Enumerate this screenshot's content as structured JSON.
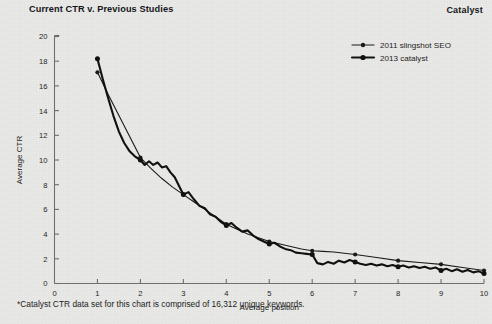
{
  "header": {
    "title": "Current CTR v. Previous Studies",
    "brand": "Catalyst"
  },
  "footnote": "*Catalyst CTR data set for this chart is comprised of 16,312 unique keywords.",
  "colors": {
    "background": "#e9e9e7",
    "ink": "#1b1b1b",
    "axis": "#6d6d6d",
    "series_slingshot": "#1a1a1a",
    "series_catalyst": "#111111"
  },
  "chart_data": {
    "type": "line",
    "title": "Current CTR v. Previous Studies",
    "xlabel": "Average position",
    "ylabel": "Average CTR",
    "xlim": [
      0,
      10
    ],
    "ylim": [
      0,
      20
    ],
    "xticks": [
      0,
      1,
      2,
      3,
      4,
      5,
      6,
      7,
      8,
      9,
      10
    ],
    "yticks": [
      0,
      2,
      4,
      6,
      8,
      10,
      12,
      14,
      16,
      18,
      20
    ],
    "grid": false,
    "legend_position": "top-right",
    "legend": [
      "2011 slingshot SEO",
      "2013 catalyst"
    ],
    "marker_positions": [
      1,
      2,
      3,
      4,
      5,
      6,
      7,
      8,
      9,
      10
    ],
    "series": [
      {
        "name": "2011 slingshot SEO",
        "line_width": 1.1,
        "markers_at": [
          1,
          2,
          3,
          4,
          5,
          6,
          7,
          8,
          9,
          10
        ],
        "x": [
          1,
          1.25,
          1.5,
          1.75,
          2,
          2.25,
          2.5,
          2.75,
          3,
          3.25,
          3.5,
          3.75,
          4,
          4.25,
          4.5,
          4.75,
          5,
          5.25,
          5.5,
          5.75,
          6,
          6.25,
          6.5,
          6.75,
          7,
          7.5,
          8,
          8.5,
          9,
          9.5,
          10
        ],
        "y": [
          17.1,
          15.3,
          13.6,
          11.9,
          10.2,
          9.3,
          8.5,
          7.8,
          7.2,
          6.6,
          6.0,
          5.4,
          4.8,
          4.4,
          4.0,
          3.7,
          3.4,
          3.2,
          3.0,
          2.8,
          2.65,
          2.6,
          2.55,
          2.45,
          2.35,
          2.1,
          1.85,
          1.7,
          1.55,
          1.3,
          1.05
        ]
      },
      {
        "name": "2013 catalyst",
        "line_width": 2.1,
        "markers_at": [
          1,
          2,
          3,
          4,
          5,
          6,
          7,
          8,
          9,
          10
        ],
        "x": [
          1,
          1.12,
          1.25,
          1.37,
          1.5,
          1.62,
          1.75,
          1.87,
          2,
          2.1,
          2.2,
          2.3,
          2.4,
          2.5,
          2.6,
          2.7,
          2.8,
          2.9,
          3,
          3.12,
          3.25,
          3.37,
          3.5,
          3.62,
          3.75,
          3.87,
          4,
          4.12,
          4.25,
          4.37,
          4.5,
          4.62,
          4.75,
          4.87,
          5,
          5.12,
          5.25,
          5.37,
          5.5,
          5.62,
          5.75,
          5.87,
          6,
          6.12,
          6.25,
          6.37,
          6.5,
          6.62,
          6.75,
          6.87,
          7,
          7.12,
          7.25,
          7.37,
          7.5,
          7.62,
          7.75,
          7.87,
          8,
          8.12,
          8.25,
          8.37,
          8.5,
          8.62,
          8.75,
          8.87,
          9,
          9.12,
          9.25,
          9.37,
          9.5,
          9.62,
          9.75,
          9.87,
          10
        ],
        "y": [
          18.2,
          16.6,
          15.0,
          13.6,
          12.3,
          11.4,
          10.7,
          10.3,
          10.0,
          9.6,
          9.9,
          9.6,
          9.8,
          9.4,
          9.5,
          9.0,
          8.6,
          7.9,
          7.2,
          7.4,
          6.8,
          6.3,
          6.1,
          5.6,
          5.4,
          5.0,
          4.7,
          4.9,
          4.5,
          4.2,
          4.3,
          3.9,
          3.6,
          3.4,
          3.2,
          3.3,
          3.0,
          2.8,
          2.7,
          2.5,
          2.45,
          2.4,
          2.35,
          1.65,
          1.55,
          1.75,
          1.6,
          1.85,
          1.7,
          1.9,
          1.75,
          1.6,
          1.5,
          1.6,
          1.45,
          1.55,
          1.4,
          1.5,
          1.35,
          1.45,
          1.3,
          1.4,
          1.25,
          1.35,
          1.2,
          1.3,
          1.05,
          1.2,
          1.0,
          1.15,
          0.95,
          1.1,
          0.9,
          1.0,
          0.8
        ]
      }
    ]
  }
}
